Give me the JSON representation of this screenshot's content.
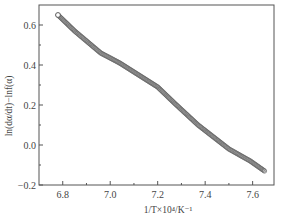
{
  "chart_data": {
    "type": "scatter",
    "title": "",
    "xlabel": "1/T×10⁴/K⁻¹",
    "ylabel": "ln(dα/dt)−lnf(α)",
    "xlim": [
      6.7,
      7.69
    ],
    "ylim": [
      -0.2,
      0.7
    ],
    "xticks": [
      6.8,
      7.0,
      7.2,
      7.4,
      7.6
    ],
    "xtick_labels": [
      "6.8",
      "7.0",
      "7.2",
      "7.4",
      "7.6"
    ],
    "xminor_ticks": [
      6.9,
      7.1,
      7.3,
      7.5
    ],
    "yticks": [
      -0.2,
      0.0,
      0.2,
      0.4,
      0.6
    ],
    "ytick_labels": [
      "−0.2",
      "0.0",
      "0.2",
      "0.4",
      "0.6"
    ],
    "yminor_ticks": [
      -0.1,
      0.1,
      0.3,
      0.5
    ],
    "grid": false,
    "legend": null,
    "series": [
      {
        "name": "data",
        "marker": "open-circle",
        "x": [
          6.78,
          6.85,
          6.96,
          7.04,
          7.12,
          7.2,
          7.27,
          7.37,
          7.5,
          7.59,
          7.65
        ],
        "y": [
          0.65,
          0.57,
          0.46,
          0.41,
          0.35,
          0.29,
          0.21,
          0.1,
          -0.02,
          -0.08,
          -0.13
        ]
      }
    ]
  }
}
